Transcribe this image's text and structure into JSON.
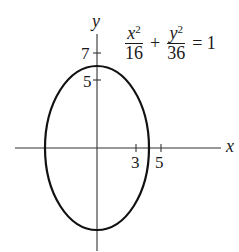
{
  "header_fragment": "(c) ...",
  "diagram": {
    "equation": {
      "term1": {
        "numerator_var": "x",
        "numerator_exp": "2",
        "denominator": "16"
      },
      "plus": "+",
      "term2": {
        "numerator_var": "y",
        "numerator_exp": "2",
        "denominator": "36"
      },
      "equals": "= 1"
    },
    "axes": {
      "x_label": "x",
      "y_label": "y"
    },
    "ticks": {
      "y": [
        {
          "label": "7",
          "value": 7
        },
        {
          "label": "5",
          "value": 5
        }
      ],
      "x": [
        {
          "label": "3",
          "value": 3
        },
        {
          "label": "5",
          "value": 5
        }
      ]
    },
    "ellipse": {
      "a_x": 4,
      "b_y": 6,
      "center": [
        0,
        0
      ]
    },
    "colors": {
      "stroke": "#111111",
      "axis": "#333333",
      "background": "#ffffff"
    }
  }
}
